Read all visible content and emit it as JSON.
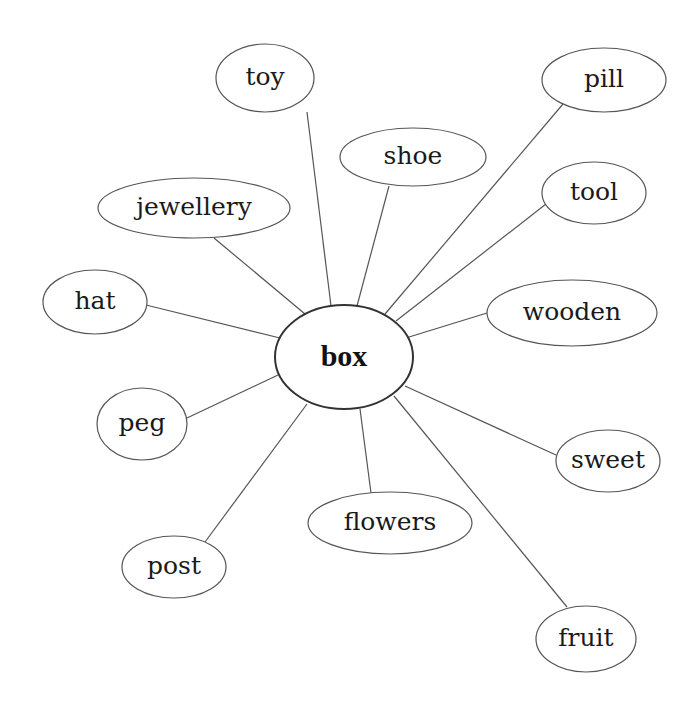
{
  "diagram": {
    "type": "word-web",
    "center": {
      "label": "box",
      "cx": 344,
      "cy": 357,
      "rx": 69,
      "ry": 52
    },
    "nodes": [
      {
        "id": "toy",
        "label": "toy",
        "cx": 265,
        "cy": 78,
        "rx": 49,
        "ry": 34,
        "edge": [
          307,
          112,
          331,
          306
        ]
      },
      {
        "id": "shoe",
        "label": "shoe",
        "cx": 413,
        "cy": 157,
        "rx": 73,
        "ry": 29,
        "edge": [
          389,
          186,
          357,
          306
        ]
      },
      {
        "id": "pill",
        "label": "pill",
        "cx": 604,
        "cy": 80,
        "rx": 62,
        "ry": 32,
        "edge": [
          563,
          104,
          385,
          314
        ]
      },
      {
        "id": "tool",
        "label": "tool",
        "cx": 594,
        "cy": 193,
        "rx": 52,
        "ry": 31,
        "edge": [
          546,
          204,
          396,
          321
        ]
      },
      {
        "id": "jewellery",
        "label": "jewellery",
        "cx": 194,
        "cy": 208,
        "rx": 96,
        "ry": 30,
        "edge": [
          214,
          238,
          305,
          314
        ]
      },
      {
        "id": "hat",
        "label": "hat",
        "cx": 95,
        "cy": 302,
        "rx": 52,
        "ry": 32,
        "edge": [
          146,
          305,
          280,
          338
        ]
      },
      {
        "id": "wooden",
        "label": "wooden",
        "cx": 572,
        "cy": 313,
        "rx": 85,
        "ry": 33,
        "edge": [
          487,
          313,
          409,
          337
        ]
      },
      {
        "id": "peg",
        "label": "peg",
        "cx": 142,
        "cy": 424,
        "rx": 45,
        "ry": 36,
        "edge": [
          187,
          418,
          278,
          375
        ]
      },
      {
        "id": "sweet",
        "label": "sweet",
        "cx": 608,
        "cy": 461,
        "rx": 52,
        "ry": 31,
        "edge": [
          556,
          455,
          405,
          386
        ]
      },
      {
        "id": "flowers",
        "label": "flowers",
        "cx": 390,
        "cy": 523,
        "rx": 82,
        "ry": 31,
        "edge": [
          371,
          493,
          360,
          409
        ]
      },
      {
        "id": "post",
        "label": "post",
        "cx": 174,
        "cy": 567,
        "rx": 52,
        "ry": 31,
        "edge": [
          205,
          542,
          307,
          404
        ]
      },
      {
        "id": "fruit",
        "label": "fruit",
        "cx": 586,
        "cy": 639,
        "rx": 50,
        "ry": 33,
        "edge": [
          567,
          607,
          394,
          396
        ]
      }
    ],
    "colors": {
      "background": "#ffffff",
      "stroke": "#555555",
      "center_stroke": "#333333",
      "text": "#1a1a1a"
    }
  }
}
